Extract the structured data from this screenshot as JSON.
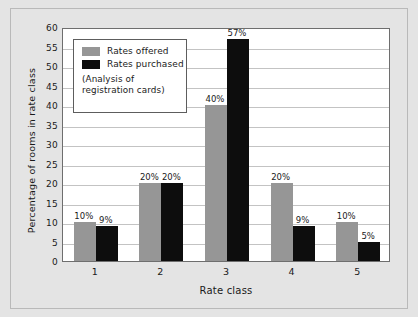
{
  "chart_data": {
    "type": "bar",
    "title": "",
    "subtitle": "",
    "xlabel": "Rate class",
    "ylabel": "Percentage of rooms in rate class",
    "categories": [
      "1",
      "2",
      "3",
      "4",
      "5"
    ],
    "series": [
      {
        "name": "Rates offered",
        "color": "#969696",
        "values": [
          10,
          20,
          40,
          20,
          10
        ],
        "labels": [
          "10%",
          "20%",
          "40%",
          "20%",
          "10%"
        ]
      },
      {
        "name": "Rates purchased",
        "color": "#0d0d0d",
        "values": [
          9,
          20,
          57,
          9,
          5
        ],
        "labels": [
          "9%",
          "20%",
          "57%",
          "9%",
          "5%"
        ]
      }
    ],
    "ylim": [
      0,
      60
    ],
    "yticks": [
      "0",
      "5",
      "10",
      "15",
      "20",
      "25",
      "30",
      "35",
      "40",
      "45",
      "50",
      "55",
      "60"
    ],
    "ytick_values": [
      0,
      5,
      10,
      15,
      20,
      25,
      30,
      35,
      40,
      45,
      50,
      55,
      60
    ],
    "grid": true,
    "grid_axis": "y",
    "legend_position": "upper-left",
    "annotations": [
      "(Analysis of",
      "registration cards)"
    ]
  },
  "legend": {
    "note_line1": "(Analysis of",
    "note_line2": "registration cards)"
  },
  "colors": {
    "background": "#e4e4e4",
    "plot_background": "#ffffff",
    "series_offered": "#969696",
    "series_purchased": "#0d0d0d",
    "gridline": "#c3c3c3",
    "axis": "#6e6e6e",
    "text": "#1a1a1a"
  }
}
